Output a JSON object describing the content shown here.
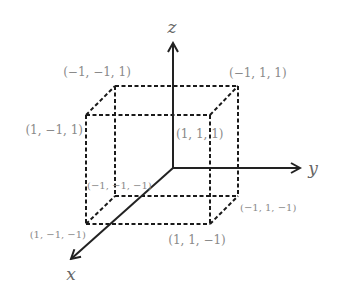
{
  "diagram": {
    "title": "",
    "axes": [
      {
        "id": "x",
        "label": "x"
      },
      {
        "id": "y",
        "label": "y"
      },
      {
        "id": "z",
        "label": "z"
      }
    ],
    "vertices": [
      {
        "id": "v_n1n1p1",
        "coords": [
          -1,
          -1,
          1
        ],
        "label": "(−1, −1, 1)"
      },
      {
        "id": "v_n1p1p1",
        "coords": [
          -1,
          1,
          1
        ],
        "label": "(−1, 1, 1)"
      },
      {
        "id": "v_p1n1p1",
        "coords": [
          1,
          -1,
          1
        ],
        "label": "(1, −1, 1)"
      },
      {
        "id": "v_p1p1p1",
        "coords": [
          1,
          1,
          1
        ],
        "label": "(1, 1, 1)"
      },
      {
        "id": "v_n1n1n1",
        "coords": [
          -1,
          -1,
          -1
        ],
        "label": "(−1, −1, −1)"
      },
      {
        "id": "v_n1p1n1",
        "coords": [
          -1,
          1,
          -1
        ],
        "label": "(−1, 1, −1)"
      },
      {
        "id": "v_p1n1n1",
        "coords": [
          1,
          -1,
          -1
        ],
        "label": "(1, −1, −1)"
      },
      {
        "id": "v_p1p1n1",
        "coords": [
          1,
          1,
          -1
        ],
        "label": "(1, 1, −1)"
      }
    ],
    "edge_style": "dashed",
    "colors": {
      "axis": "#222222",
      "edge": "#1a1a1a",
      "vertex_label": "#8a8a8a",
      "axis_label": "#666666"
    }
  }
}
